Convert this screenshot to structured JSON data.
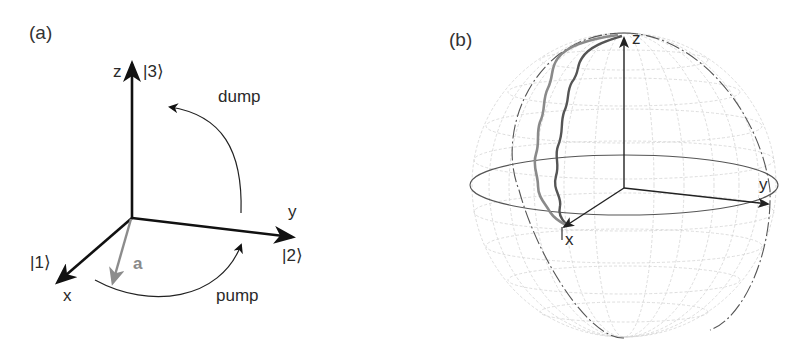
{
  "figure": {
    "panels": [
      {
        "tag": "(a)",
        "type": "3d-axes-state-diagram",
        "axes": {
          "z": {
            "label": "z",
            "state": "|3⟩"
          },
          "y": {
            "label": "y",
            "state": "|2⟩"
          },
          "x": {
            "label": "x",
            "state": "|1⟩"
          }
        },
        "vector": {
          "label": "a",
          "color": "#8c8c8c"
        },
        "arrows": {
          "dump": {
            "label": "dump"
          },
          "pump": {
            "label": "pump"
          }
        }
      },
      {
        "tag": "(b)",
        "type": "bloch-sphere",
        "axes": {
          "z": {
            "label": "z"
          },
          "y": {
            "label": "y"
          },
          "x": {
            "label": "x"
          }
        },
        "trajectories": [
          {
            "name": "trajectory-1",
            "color": "#555555"
          },
          {
            "name": "trajectory-2",
            "color": "#888888"
          }
        ]
      }
    ]
  },
  "colors": {
    "axis": "#1a1a1a",
    "vector_a": "#8c8c8c",
    "grid": "#d0d0d0",
    "sphere_outline": "#444444"
  }
}
